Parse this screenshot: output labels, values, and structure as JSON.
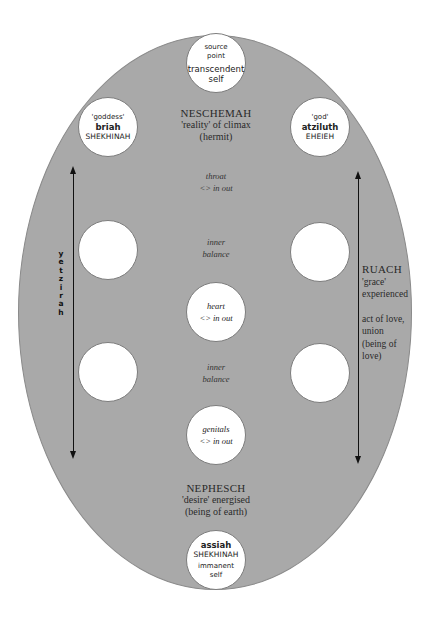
{
  "diagram": {
    "colors": {
      "background": "#ffffff",
      "ellipse": "#a9a9a9",
      "node": "#ffffff",
      "arrow": "#111111"
    },
    "nodes": {
      "top": {
        "line1": "source",
        "line2": "point",
        "line3": "transcendent",
        "line4": "self"
      },
      "upper_left": {
        "line1": "'goddess'",
        "line2": "briah",
        "line3": "SHEKHINAH"
      },
      "upper_right": {
        "line1": "'god'",
        "line2": "atziluth",
        "line3": "EHEIEH"
      },
      "middle_left": {},
      "middle_right": {},
      "heart": {
        "line1": "heart",
        "line2": "<> in out"
      },
      "lower_left": {},
      "lower_right": {},
      "genitals": {
        "line1": "genitals",
        "line2": "<> in out"
      },
      "bottom": {
        "line1": "assiah",
        "line2": "SHEKHINAH",
        "line3": "immanent",
        "line4": "self"
      }
    },
    "labels": {
      "neschemah": {
        "title": "NESCHEMAH",
        "line1": "'reality' of climax",
        "line2": "(hermit)"
      },
      "throat": {
        "line1": "throat",
        "line2": "<> in out"
      },
      "inner_balance_upper": {
        "line1": "inner",
        "line2": "balance"
      },
      "inner_balance_lower": {
        "line1": "inner",
        "line2": "balance"
      },
      "nephesch": {
        "title": "NEPHESCH",
        "line1": "'desire' energised",
        "line2": "(being of earth)"
      },
      "ruach": {
        "title": "RUACH",
        "line1": "'grace'",
        "line2": "experienced",
        "line3": "act of love,",
        "line4": "union",
        "line5": "(being of",
        "line6": "love)"
      },
      "yetzirah": {
        "letters": [
          "y",
          "e",
          "t",
          "z",
          "i",
          "r",
          "a",
          "h"
        ]
      }
    },
    "arrows": [
      {
        "name": "left-vertical-arrow",
        "x": 73,
        "y_top": 166,
        "y_bottom": 458,
        "heads": "both"
      },
      {
        "name": "right-vertical-arrow",
        "x": 358,
        "y_top": 171,
        "y_bottom": 463,
        "heads": "both"
      }
    ]
  }
}
